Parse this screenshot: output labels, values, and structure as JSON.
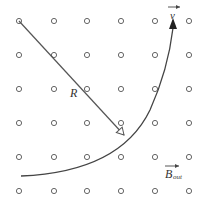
{
  "diagram": {
    "grid": {
      "columns": [
        19,
        54,
        87,
        121,
        155,
        189
      ],
      "rows": [
        21,
        55,
        89,
        123,
        157,
        191
      ],
      "symbol": "dot-out-of-page-circle"
    },
    "radius_label": "R",
    "velocity_label": "v",
    "field_label": "B",
    "field_subscript": "out",
    "colors": {
      "stroke": "#555555",
      "text": "#333333",
      "background": "#ffffff"
    }
  }
}
